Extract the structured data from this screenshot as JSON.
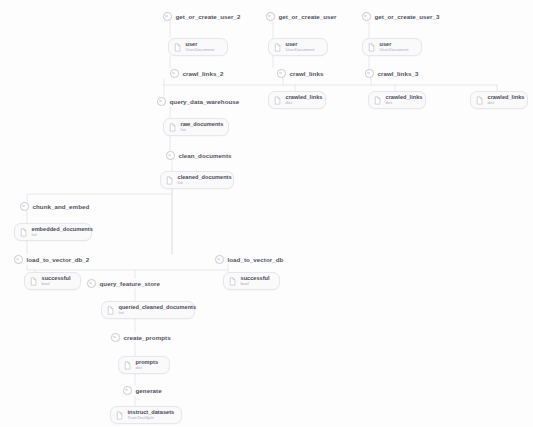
{
  "pipeline": {
    "background": "#fdfdfd",
    "edge_color": "#e2e2e9",
    "step_label_color": "#52525e",
    "artifact_name_color": "#4a4a57",
    "artifact_type_color": "#adadb8"
  },
  "steps": [
    {
      "id": "get_or_create_user_2",
      "label": "get_or_create_user_2",
      "x": 163,
      "y": 11
    },
    {
      "id": "get_or_create_user",
      "label": "get_or_create_user",
      "x": 266,
      "y": 11
    },
    {
      "id": "get_or_create_user_3",
      "label": "get_or_create_user_3",
      "x": 362,
      "y": 11
    },
    {
      "id": "crawl_links_2",
      "label": "crawl_links_2",
      "x": 170,
      "y": 68
    },
    {
      "id": "crawl_links",
      "label": "crawl_links",
      "x": 277,
      "y": 68
    },
    {
      "id": "crawl_links_3",
      "label": "crawl_links_3",
      "x": 365,
      "y": 68
    },
    {
      "id": "query_data_warehouse",
      "label": "query_data_warehouse",
      "x": 157,
      "y": 96
    },
    {
      "id": "clean_documents",
      "label": "clean_documents",
      "x": 166,
      "y": 150
    },
    {
      "id": "chunk_and_embed",
      "label": "chunk_and_embed",
      "x": 20,
      "y": 201
    },
    {
      "id": "load_to_vector_db_2",
      "label": "load_to_vector_db_2",
      "x": 14,
      "y": 254
    },
    {
      "id": "load_to_vector_db",
      "label": "load_to_vector_db",
      "x": 215,
      "y": 254
    },
    {
      "id": "query_feature_store",
      "label": "query_feature_store",
      "x": 87,
      "y": 278
    },
    {
      "id": "create_prompts",
      "label": "create_prompts",
      "x": 111,
      "y": 332
    },
    {
      "id": "generate",
      "label": "generate",
      "x": 123,
      "y": 385
    }
  ],
  "artifacts": [
    {
      "id": "user_2",
      "name": "user",
      "type": "UserDocument",
      "x": 168,
      "y": 38,
      "w": 60
    },
    {
      "id": "user_1",
      "name": "user",
      "type": "UserDocument",
      "x": 268,
      "y": 38,
      "w": 60
    },
    {
      "id": "user_3",
      "name": "user",
      "type": "UserDocument",
      "x": 362,
      "y": 38,
      "w": 60
    },
    {
      "id": "crawled_links_1",
      "name": "crawled_links",
      "type": "dict",
      "x": 268,
      "y": 91,
      "w": 58
    },
    {
      "id": "crawled_links_2",
      "name": "crawled_links",
      "type": "dict",
      "x": 368,
      "y": 91,
      "w": 58
    },
    {
      "id": "crawled_links_3",
      "name": "crawled_links",
      "type": "dict",
      "x": 470,
      "y": 91,
      "w": 58
    },
    {
      "id": "raw_documents",
      "name": "raw_documents",
      "type": "list",
      "x": 163,
      "y": 118,
      "w": 66
    },
    {
      "id": "cleaned_documents",
      "name": "cleaned_documents",
      "type": "list",
      "x": 160,
      "y": 171,
      "w": 74
    },
    {
      "id": "embedded_documents",
      "name": "embedded_documents",
      "type": "list",
      "x": 14,
      "y": 223,
      "w": 78
    },
    {
      "id": "successful_2",
      "name": "successful",
      "type": "bool",
      "x": 24,
      "y": 272,
      "w": 57
    },
    {
      "id": "successful_1",
      "name": "successful",
      "type": "bool",
      "x": 223,
      "y": 272,
      "w": 57
    },
    {
      "id": "queried_cleaned_documents",
      "name": "queried_cleaned_documents",
      "type": "list",
      "x": 101,
      "y": 301,
      "w": 94
    },
    {
      "id": "prompts",
      "name": "prompts",
      "type": "dict",
      "x": 118,
      "y": 356,
      "w": 52
    },
    {
      "id": "instruct_datasets",
      "name": "instruct_datasets",
      "type": "TrainTestSplit",
      "x": 110,
      "y": 406,
      "w": 72
    }
  ],
  "edges": [
    "M 170 22 L 170 38",
    "M 273 22 L 273 38",
    "M 369 22 L 369 38",
    "M 170 56 L 170 68",
    "M 273 56 L 273 68",
    "M 369 56 L 369 68",
    "M 164 79 L 164 85 L 497 85",
    "M 283 79 L 283 85",
    "M 371 79 L 371 85",
    "M 164 85 L 164 96",
    "M 295 85 L 295 91",
    "M 395 85 L 395 91",
    "M 497 85 L 497 91",
    "M 170 107 L 170 118",
    "M 170 135 L 170 150",
    "M 172 161 L 172 171",
    "M 172 188 L 172 194 L 27 194 L 27 201",
    "M 172 188 L 172 254",
    "M 172 194 L 172 254",
    "M 27 212 L 27 223",
    "M 27 240 L 27 254",
    "M 27 265 L 27 270 L 228 270 L 228 265",
    "M 135 270 L 135 278",
    "M 35 270 L 35 272",
    "M 228 270 L 228 272",
    "M 135 289 L 135 301",
    "M 135 318 L 135 332",
    "M 135 343 L 135 356",
    "M 135 373 L 135 385",
    "M 135 396 L 135 406"
  ]
}
